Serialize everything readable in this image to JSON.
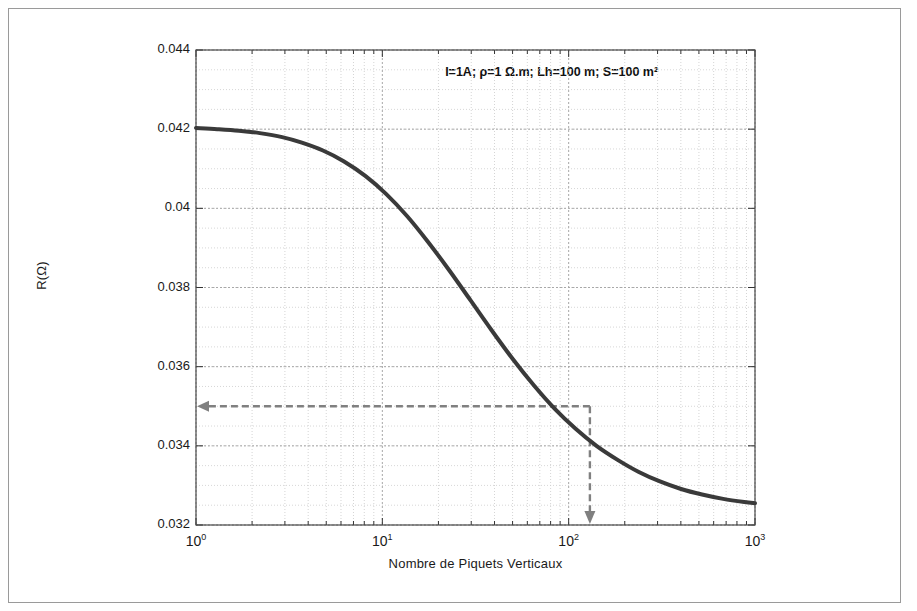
{
  "figure": {
    "annotation": "I=1A; ρ=1 Ω.m; Lh=100 m; S=100 m²",
    "border_color": "#9a9a9a",
    "background": "#ffffff"
  },
  "chart_data": {
    "type": "line",
    "title": "",
    "subtitle": "",
    "xlabel": "Nombre de Piquets  Verticaux",
    "ylabel": "R(Ω)",
    "xscale": "log",
    "yscale": "linear",
    "xlim": [
      1,
      1000
    ],
    "ylim": [
      0.032,
      0.044
    ],
    "grid": true,
    "minor_grid": true,
    "legend": null,
    "xticks": [
      1,
      10,
      100,
      1000
    ],
    "xticklabels": [
      "10^0",
      "10^1",
      "10^2",
      "10^3"
    ],
    "yticks": [
      0.032,
      0.034,
      0.036,
      0.038,
      0.04,
      0.042,
      0.044
    ],
    "yticklabels": [
      "0.032",
      "0.034",
      "0.036",
      "0.038",
      "0.04",
      "0.042",
      "0.044"
    ],
    "series": [
      {
        "name": "R vs nombre de piquets",
        "color": "#3a3a3a",
        "linewidth": 4,
        "x": [
          1,
          1.3,
          1.7,
          2.2,
          2.9,
          3.7,
          4.8,
          6.2,
          8.1,
          10.5,
          13.6,
          17.6,
          22.9,
          29.7,
          38.6,
          50,
          65,
          84,
          109,
          141,
          184,
          238,
          309,
          401,
          520,
          675,
          876,
          1000
        ],
        "y": [
          0.04203,
          0.042,
          0.04196,
          0.0419,
          0.0418,
          0.04166,
          0.04146,
          0.04119,
          0.04082,
          0.04036,
          0.0398,
          0.03915,
          0.03843,
          0.03768,
          0.03692,
          0.0362,
          0.03553,
          0.03494,
          0.03443,
          0.034,
          0.03364,
          0.03334,
          0.0331,
          0.03291,
          0.03277,
          0.03266,
          0.03258,
          0.03255
        ]
      }
    ],
    "annotations": [
      {
        "type": "text",
        "text": "I=1A; ρ=1 Ω.m; Lh=100 m; S=100 m²",
        "x": 22,
        "y": 0.0434
      },
      {
        "type": "arrow",
        "name": "horizontal-readout-arrow",
        "style": "dashed",
        "color": "#7a7a7a",
        "from": {
          "x": 130,
          "y": 0.035
        },
        "to": {
          "x": 1,
          "y": 0.035
        }
      },
      {
        "type": "arrow",
        "name": "vertical-readout-arrow",
        "style": "dashed",
        "color": "#7a7a7a",
        "from": {
          "x": 130,
          "y": 0.035
        },
        "to": {
          "x": 130,
          "y": 0.032
        }
      }
    ],
    "readout": {
      "x": 130,
      "y": 0.035
    }
  }
}
